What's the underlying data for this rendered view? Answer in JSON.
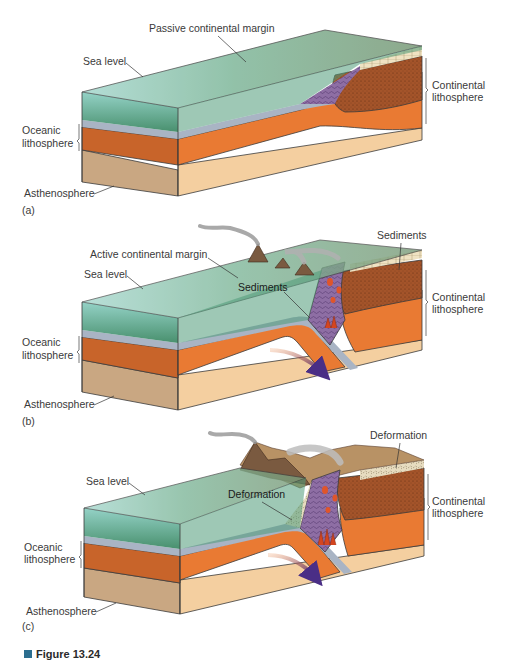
{
  "figure": {
    "caption_label": "Figure 13.24",
    "caption_marker_color": "#2c6e8f"
  },
  "panels": [
    {
      "id": "a",
      "panel_label": "(a)",
      "labels": {
        "margin": "Passive continental margin",
        "sea_level": "Sea level",
        "continental_1": "Continental",
        "continental_2": "lithosphere",
        "oceanic_1": "Oceanic",
        "oceanic_2": "lithosphere",
        "asthenosphere": "Asthenosphere"
      }
    },
    {
      "id": "b",
      "panel_label": "(b)",
      "labels": {
        "margin": "Active continental margin",
        "sea_level": "Sea level",
        "sediments_top": "Sediments",
        "sediments_inner": "Sediments",
        "continental_1": "Continental",
        "continental_2": "lithosphere",
        "oceanic_1": "Oceanic",
        "oceanic_2": "lithosphere",
        "asthenosphere": "Asthenosphere"
      }
    },
    {
      "id": "c",
      "panel_label": "(c)",
      "labels": {
        "deformation_top": "Deformation",
        "sea_level": "Sea level",
        "deformation_inner": "Deformation",
        "continental_1": "Continental",
        "continental_2": "lithosphere",
        "oceanic_1": "Oceanic",
        "oceanic_2": "lithosphere",
        "asthenosphere": "Asthenosphere"
      }
    }
  ],
  "colors": {
    "water": "#7fc4b8",
    "seafloor": "#3f8a66",
    "oceanic_crust": "#a9b4c4",
    "lithosphere_orange": "#e97a33",
    "lithosphere_dark": "#c8642a",
    "asthenosphere_front": "#c9a782",
    "asthenosphere_side": "#f4cfa0",
    "continental_crust": "#a4542a",
    "accretionary_wedge": "#8e6ea4",
    "magma": "#e0552a",
    "mountain": "#7a5a40",
    "plateau": "#b89265",
    "smoke": "#9a9a9a"
  }
}
